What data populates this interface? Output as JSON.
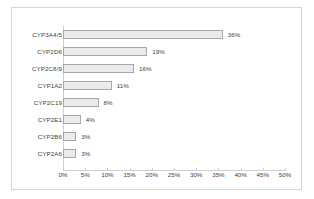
{
  "chart_data": {
    "type": "bar",
    "orientation": "horizontal",
    "title": "",
    "xlabel": "",
    "ylabel": "",
    "categories": [
      "CYP3A4/5",
      "CYP2D6",
      "CYP2C8/9",
      "CYP1A2",
      "CYP2C19",
      "CYP2E1",
      "CYP2B6",
      "CYP2A6"
    ],
    "values": [
      36,
      19,
      16,
      11,
      8,
      4,
      3,
      3
    ],
    "data_labels": [
      "36%",
      "19%",
      "16%",
      "11%",
      "8%",
      "4%",
      "3%",
      "3%"
    ],
    "xlim": [
      0,
      50
    ],
    "xticks": [
      0,
      5,
      10,
      15,
      20,
      25,
      30,
      35,
      40,
      45,
      50
    ],
    "xticklabels": [
      "0%",
      "5%",
      "10%",
      "15%",
      "20%",
      "25%",
      "30%",
      "35%",
      "40%",
      "45%",
      "50%"
    ],
    "grid": false,
    "legend": false,
    "colors": {
      "bar_fill": "#ebebeb",
      "bar_border": "#a8a8a8",
      "axis": "#cfcfcf",
      "text": "#404040",
      "frame": "#d6d6d6",
      "background": "#ffffff"
    }
  }
}
